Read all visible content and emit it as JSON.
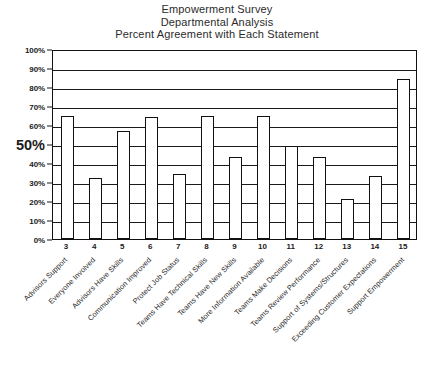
{
  "title": {
    "line1": "Empowerment Survey",
    "line2": "Departmental Analysis",
    "line3": "Percent Agreement with Each Statement"
  },
  "axis": {
    "y_tick_labels": [
      "100%",
      "90%",
      "80%",
      "70%",
      "60%",
      "50%",
      "40%",
      "30%",
      "20%",
      "10%",
      "0%"
    ],
    "y_emphasis_label": "50%"
  },
  "chart_data": {
    "type": "bar",
    "title": "Empowerment Survey Departmental Analysis Percent Agreement with Each Statement",
    "xlabel": "",
    "ylabel": "",
    "ylim": [
      0,
      100
    ],
    "ytick_step": 10,
    "grid": true,
    "legend": "none",
    "categories": [
      "Advisors Support",
      "Everyone Involved",
      "Advisors Have Skills",
      "Communication Improved",
      "Protect Job Status",
      "Teams Have Technical Skills",
      "Teams Have New Skills",
      "More Information Available",
      "Teams Make Decisions",
      "Teams Review Performance",
      "Support of Systems/Structures",
      "Exceeding Customer Expectations",
      "Support Empowerment"
    ],
    "x": [
      "3",
      "4",
      "5",
      "6",
      "7",
      "8",
      "9",
      "10",
      "11",
      "12",
      "13",
      "14",
      "15"
    ],
    "values": [
      65,
      32,
      57,
      64,
      34,
      65,
      43,
      65,
      49,
      43,
      21,
      33,
      84
    ],
    "units": "percent"
  }
}
